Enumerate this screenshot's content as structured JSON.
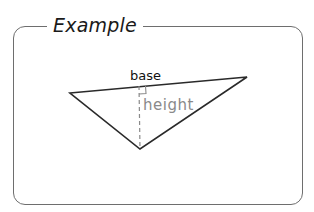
{
  "frame": {
    "title": "Example",
    "border_color": "#6e6e6e"
  },
  "diagram": {
    "shape": "triangle",
    "vertices": {
      "left": [
        70,
        93
      ],
      "right": [
        247,
        77
      ],
      "bottom": [
        140,
        149
      ]
    },
    "labels": {
      "base": "base",
      "height": "height"
    },
    "colors": {
      "lines": "#2a2a2a",
      "base_label": "#111111",
      "height_label": "#8a8a8a",
      "height_line": "#8a8a8a"
    },
    "right_angle_marker": true,
    "height_line_style": "dashed"
  }
}
